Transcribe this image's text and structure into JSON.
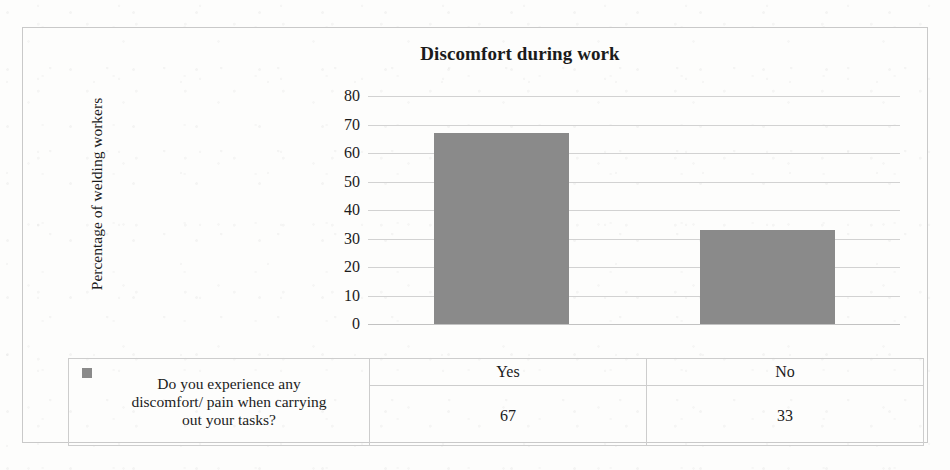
{
  "chart_data": {
    "type": "bar",
    "title": "Discomfort during work",
    "xlabel": "",
    "ylabel": "Percentage of welding workers",
    "categories": [
      "Yes",
      "No"
    ],
    "values": [
      67,
      33
    ],
    "series": [
      {
        "name": "Do you experience any discomfort/ pain when carrying out your tasks?",
        "values": [
          67,
          33
        ],
        "color": "#8a8a8a"
      }
    ],
    "ylim": [
      0,
      80
    ],
    "yticks": [
      80,
      70,
      60,
      50,
      40,
      30,
      20,
      10,
      0
    ],
    "grid": "horizontal",
    "legend_position": "bottom-left-table",
    "data_table_shown": true
  },
  "legend": {
    "marker_color": "#8a8a8a",
    "lines": [
      "Do you experience any",
      "discomfort/ pain when carrying",
      "out your tasks?"
    ],
    "full_text": "Do you experience any discomfort/ pain when carrying out your tasks?"
  },
  "table": {
    "category_row": [
      "Yes",
      "No"
    ],
    "value_row": [
      "67",
      "33"
    ]
  }
}
